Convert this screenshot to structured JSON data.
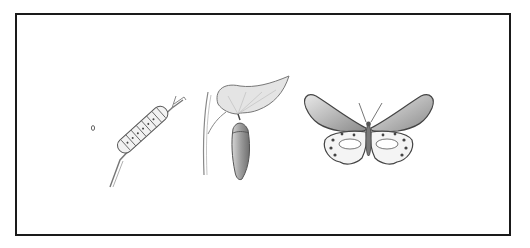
{
  "diagram": {
    "style": "pencil sketch",
    "stages": [
      {
        "name": "egg",
        "order": 1
      },
      {
        "name": "caterpillar",
        "order": 2
      },
      {
        "name": "chrysalis",
        "order": 3
      },
      {
        "name": "butterfly",
        "order": 4
      }
    ],
    "colors": {
      "border": "#1a1a1a",
      "stroke": "#555555",
      "shade": "#9a9a9a",
      "background": "#ffffff"
    }
  }
}
